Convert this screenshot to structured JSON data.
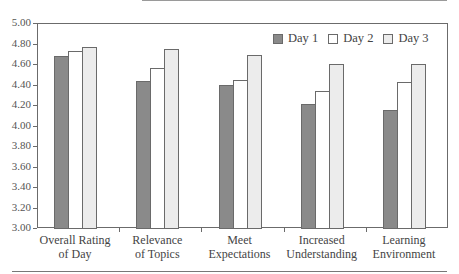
{
  "chart_data": {
    "type": "bar",
    "title": "",
    "xlabel": "",
    "ylabel": "",
    "ylim": [
      3.0,
      5.0
    ],
    "grid": false,
    "legend_position": "top-right",
    "yticks": [
      "5.00",
      "4.80",
      "4.60",
      "4.40",
      "4.20",
      "4.00",
      "3.80",
      "3.60",
      "3.40",
      "3.20",
      "3.00"
    ],
    "categories": [
      [
        "Overall Rating",
        "of Day"
      ],
      [
        "Relevance",
        "of Topics"
      ],
      [
        "Meet",
        "Expectations"
      ],
      [
        "Increased",
        "Understanding"
      ],
      [
        "Learning",
        "Environment"
      ]
    ],
    "series": [
      {
        "name": "Day 1",
        "color": "#8a8a8a",
        "values": [
          4.68,
          4.43,
          4.4,
          4.21,
          4.15
        ]
      },
      {
        "name": "Day 2",
        "color": "#ffffff",
        "values": [
          4.73,
          4.56,
          4.44,
          4.34,
          4.42
        ]
      },
      {
        "name": "Day 3",
        "color": "#ececec",
        "values": [
          4.77,
          4.75,
          4.69,
          4.6,
          4.6
        ]
      }
    ]
  }
}
